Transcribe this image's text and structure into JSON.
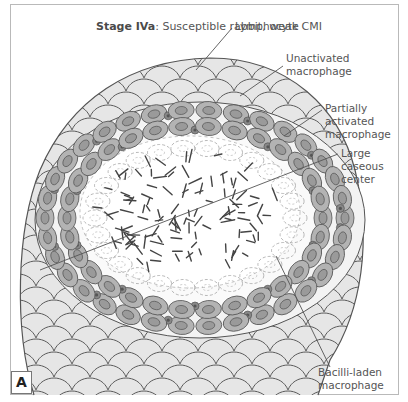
{
  "figure": {
    "title_bold": "Stage IVa",
    "title_rest": ": Susceptible rabbit, weak CMI",
    "panel_letter": "A"
  },
  "labels": {
    "lymphocyte": "Lymphocyte",
    "unactivated_1": "Unactivated",
    "unactivated_2": "macrophage",
    "partially_1": "Partially",
    "partially_2": "activated",
    "partially_3": "macrophage",
    "caseous_1": "Large",
    "caseous_2": "caseous",
    "caseous_3": "center",
    "bacilli_1": "Bacilli-laden",
    "bacilli_2": "macrophage"
  },
  "colors": {
    "outer_cell_fill": "#e6e6e6",
    "macrophage_fill": "#b3b3b3",
    "nucleus_fill": "#9a9a9a",
    "outline": "#555555",
    "caseous_fill": "#ffffff",
    "frame": "#b9b9b9"
  }
}
